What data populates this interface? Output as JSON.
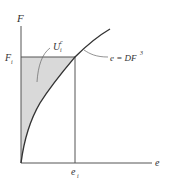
{
  "diagram": {
    "y_axis_label": "F",
    "x_axis_label": "e",
    "y_marker_label": "F",
    "y_marker_sub": "i",
    "x_marker_label": "e",
    "x_marker_sub": "i",
    "area_label": "U",
    "area_label_sub": "i",
    "area_label_sup": "c",
    "curve_label_lhs": "e = DF",
    "curve_label_exp": "3",
    "colors": {
      "axis": "#555555",
      "curve": "#333333",
      "shade": "#d9d9d9",
      "text": "#333333"
    }
  }
}
